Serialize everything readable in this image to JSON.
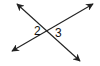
{
  "diagram": {
    "type": "intersecting-lines",
    "line_color": "#222222",
    "lines": [
      {
        "name": "line-a",
        "x1": 17,
        "y1": 4,
        "x2": 80,
        "y2": 61
      },
      {
        "name": "line-b",
        "x1": 12,
        "y1": 51,
        "x2": 93,
        "y2": 4
      }
    ],
    "angle_labels": [
      {
        "text": "2",
        "x": 34,
        "y": 35
      },
      {
        "text": "3",
        "x": 55,
        "y": 37
      }
    ]
  }
}
